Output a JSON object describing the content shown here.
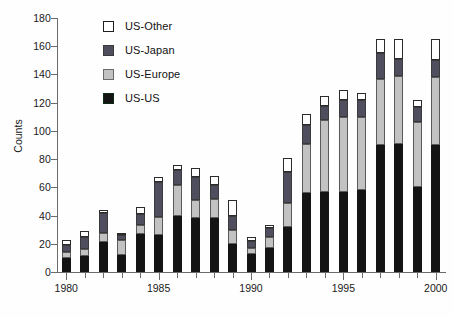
{
  "chart_data": {
    "type": "bar",
    "title": "",
    "xlabel": "",
    "ylabel": "Counts",
    "stacked": true,
    "grid": false,
    "legend_position": "top-left-inside",
    "ylim": [
      0,
      180
    ],
    "y_ticks": [
      0,
      20,
      40,
      60,
      80,
      100,
      120,
      140,
      160,
      180
    ],
    "xlim": [
      1979.5,
      2000.5
    ],
    "x_ticks": [
      1980,
      1985,
      1990,
      1995,
      2000
    ],
    "x_tick_labels": [
      "1980",
      "1985",
      "1990",
      "1995",
      "2000"
    ],
    "categories": [
      1980,
      1981,
      1982,
      1983,
      1984,
      1985,
      1986,
      1987,
      1988,
      1989,
      1990,
      1991,
      1992,
      1993,
      1994,
      1995,
      1996,
      1997,
      1998,
      1999,
      2000
    ],
    "series": [
      {
        "name": "US-US",
        "color": "#141414",
        "values": [
          10,
          11,
          21,
          12,
          27,
          26,
          40,
          38,
          38,
          20,
          13,
          17,
          32,
          56,
          57,
          57,
          58,
          90,
          91,
          60,
          90
        ]
      },
      {
        "name": "US-Europe",
        "color": "#c2c2c2",
        "values": [
          4,
          5,
          7,
          11,
          6,
          13,
          22,
          13,
          14,
          10,
          4,
          8,
          17,
          35,
          51,
          53,
          52,
          47,
          48,
          46,
          48
        ]
      },
      {
        "name": "US-Japan",
        "color": "#4e4e5e",
        "values": [
          5,
          9,
          14,
          3,
          8,
          25,
          10,
          16,
          10,
          10,
          5,
          6,
          22,
          13,
          10,
          12,
          12,
          18,
          12,
          11,
          12
        ]
      },
      {
        "name": "US-Other",
        "color": "#ffffff",
        "values": [
          4,
          4,
          2,
          2,
          5,
          3,
          4,
          7,
          6,
          11,
          3,
          2,
          10,
          8,
          7,
          7,
          5,
          10,
          14,
          5,
          15
        ]
      }
    ],
    "totals": [
      23,
      29,
      44,
      28,
      46,
      67,
      76,
      74,
      68,
      51,
      25,
      33,
      81,
      112,
      125,
      129,
      127,
      165,
      165,
      122,
      165
    ]
  },
  "legend": {
    "items": [
      {
        "label": "US-Other",
        "swatch": "legend-swatch-other"
      },
      {
        "label": "US-Japan",
        "swatch": "legend-swatch-japan"
      },
      {
        "label": "US-Europe",
        "swatch": "legend-swatch-europe"
      },
      {
        "label": "US-US",
        "swatch": "legend-swatch-us"
      }
    ]
  },
  "axes": {
    "y_title": "Counts"
  }
}
